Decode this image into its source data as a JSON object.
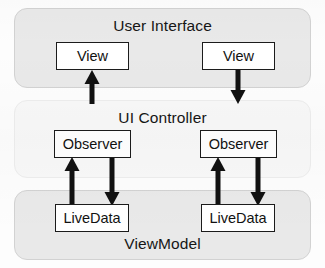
{
  "diagram": {
    "layers": [
      {
        "id": "user-interface",
        "label": "User Interface",
        "fill": "#e9e9e9",
        "stroke": "#d2d2d2",
        "x": 14,
        "y": 8,
        "width": 297,
        "height": 80,
        "title_top": 8
      },
      {
        "id": "ui-controller",
        "label": "UI Controller",
        "fill": "#f8f8f8",
        "stroke": "#ededed",
        "x": 14,
        "y": 100,
        "width": 297,
        "height": 78,
        "title_top": 8
      },
      {
        "id": "view-model",
        "label": "ViewModel",
        "fill": "#e9e9e9",
        "stroke": "#d2d2d2",
        "x": 14,
        "y": 190,
        "width": 297,
        "height": 70,
        "title_top": 44
      }
    ],
    "nodes": [
      {
        "id": "view-left",
        "label": "View",
        "x": 56,
        "y": 42,
        "width": 73,
        "height": 28
      },
      {
        "id": "view-right",
        "label": "View",
        "x": 202,
        "y": 42,
        "width": 73,
        "height": 28
      },
      {
        "id": "observer-left",
        "label": "Observer",
        "x": 54,
        "y": 130,
        "width": 77,
        "height": 28
      },
      {
        "id": "observer-right",
        "label": "Observer",
        "x": 200,
        "y": 130,
        "width": 77,
        "height": 28
      },
      {
        "id": "livedata-left",
        "label": "LiveData",
        "x": 55,
        "y": 204,
        "width": 74,
        "height": 28
      },
      {
        "id": "livedata-right",
        "label": "LiveData",
        "x": 201,
        "y": 204,
        "width": 74,
        "height": 28
      }
    ],
    "arrows": [
      {
        "id": "ui-controller-to-view-left",
        "x": 92,
        "from_y": 104,
        "to_y": 70,
        "direction": "up",
        "from": "ui-controller",
        "to": "view-left"
      },
      {
        "id": "view-right-to-ui-controller",
        "x": 238,
        "from_y": 70,
        "to_y": 104,
        "direction": "down",
        "from": "view-right",
        "to": "ui-controller"
      },
      {
        "id": "livedata-left-to-observer-left",
        "x": 72,
        "from_y": 206,
        "to_y": 157,
        "direction": "up",
        "from": "livedata-left",
        "to": "observer-left"
      },
      {
        "id": "observer-left-to-livedata-left",
        "x": 112,
        "from_y": 157,
        "to_y": 206,
        "direction": "down",
        "from": "observer-left",
        "to": "livedata-left"
      },
      {
        "id": "livedata-right-to-observer-right",
        "x": 218,
        "from_y": 206,
        "to_y": 157,
        "direction": "up",
        "from": "livedata-right",
        "to": "observer-right"
      },
      {
        "id": "observer-right-to-livedata-right",
        "x": 258,
        "from_y": 157,
        "to_y": 206,
        "direction": "down",
        "from": "observer-right",
        "to": "livedata-right"
      }
    ],
    "arrow_style": {
      "color": "#111111",
      "stem_width": 5,
      "head_width": 15,
      "head_length": 14
    }
  }
}
